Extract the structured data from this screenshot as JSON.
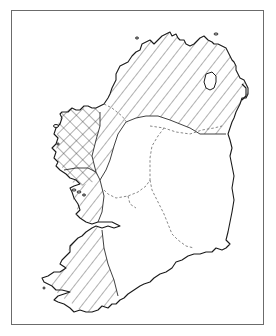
{
  "figure": {
    "type": "thematic map",
    "has_text_labels": false,
    "frame": {
      "x": 11,
      "y": 10,
      "width": 253,
      "height": 315,
      "color": "#6b6b6b"
    },
    "colors": {
      "background": "#ffffff",
      "coastline": "#1a1a1a",
      "hatch": "#3a3a3a",
      "internal_boundary": "#6a6a6a"
    },
    "legend": null,
    "regions": [
      {
        "id": "north",
        "pattern": "diagonal-hatch",
        "description": "Northern region (Ulster) with single diagonal hatching"
      },
      {
        "id": "west",
        "pattern": "cross-hatch",
        "description": "Western region (Connacht) with cross-hatching"
      },
      {
        "id": "west-coast-strip",
        "pattern": "diagonal-hatch",
        "description": "Strip along the western coast between cross-hatched area and Shannon"
      },
      {
        "id": "southwest",
        "pattern": "diagonal-hatch",
        "description": "Southwestern region (Kerry / west Cork) with diagonal hatching"
      },
      {
        "id": "east-south",
        "pattern": "none",
        "description": "Unshaded eastern and southern region"
      }
    ],
    "features": [
      {
        "id": "lough-neagh",
        "type": "lake"
      },
      {
        "id": "internal-boundaries",
        "type": "dashed-lines"
      }
    ]
  }
}
